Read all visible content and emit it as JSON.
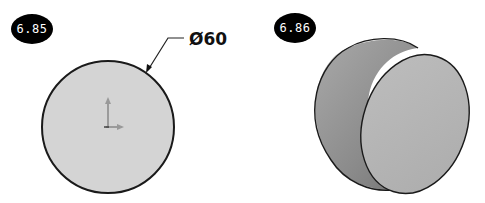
{
  "figures": [
    {
      "label": "6.85",
      "view": "front-view-circle",
      "dimension": {
        "symbol": "Ø",
        "value": "60",
        "text": "Ø60"
      },
      "fill_color": "#d4d4d4",
      "outline_color": "#1a1a1a"
    },
    {
      "label": "6.86",
      "view": "isometric-cylinder",
      "face_color": "#b8b8b8",
      "side_color_dark": "#7a7a7a",
      "side_color_light": "#a8a8a8",
      "outline_color": "#1a1a1a"
    }
  ]
}
